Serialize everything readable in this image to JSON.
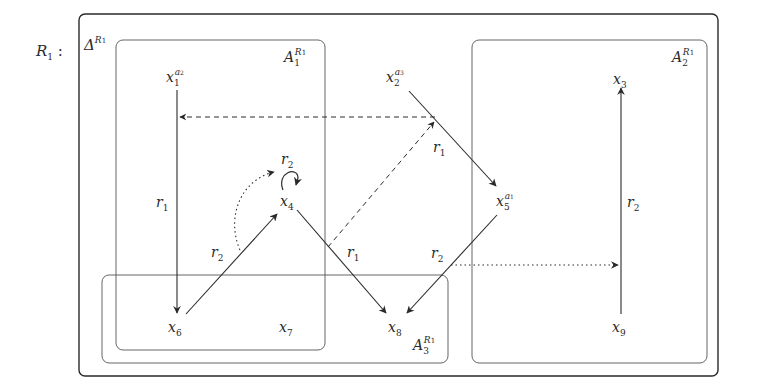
{
  "diagram": {
    "title_label": {
      "base": "R",
      "sub": "1",
      "suffix": " :"
    },
    "outer_box": {
      "base": "Δ",
      "sup_base": "R",
      "sup_sub": "1"
    },
    "regions": [
      {
        "id": "A1",
        "base": "A",
        "sub": "1",
        "sup_base": "R",
        "sup_sub": "1"
      },
      {
        "id": "A2",
        "base": "A",
        "sub": "2",
        "sup_base": "R",
        "sup_sub": "1"
      },
      {
        "id": "A3",
        "base": "A",
        "sub": "3",
        "sup_base": "R",
        "sup_sub": "1"
      }
    ],
    "nodes": [
      {
        "id": "x1",
        "base": "x",
        "sub": "1",
        "sup": "a",
        "sup_sub": "2"
      },
      {
        "id": "x2",
        "base": "x",
        "sub": "2",
        "sup": "a",
        "sup_sub": "3"
      },
      {
        "id": "x3",
        "base": "x",
        "sub": "3"
      },
      {
        "id": "x4",
        "base": "x",
        "sub": "4"
      },
      {
        "id": "x5",
        "base": "x",
        "sub": "5",
        "sup": "a",
        "sup_sub": "1"
      },
      {
        "id": "x6",
        "base": "x",
        "sub": "6"
      },
      {
        "id": "x7",
        "base": "x",
        "sub": "7"
      },
      {
        "id": "x8",
        "base": "x",
        "sub": "8"
      },
      {
        "id": "x9",
        "base": "x",
        "sub": "9"
      }
    ],
    "edges": [
      {
        "from": "x1",
        "to": "x6",
        "label": "r",
        "label_sub": "1",
        "style": "solid"
      },
      {
        "from": "x6",
        "to": "x4",
        "label": "r",
        "label_sub": "2",
        "style": "solid"
      },
      {
        "from": "x4",
        "to": "x4",
        "label": "r",
        "label_sub": "2",
        "style": "solid-loop"
      },
      {
        "from": "x4",
        "to": "x8",
        "label": "r",
        "label_sub": "1",
        "style": "solid"
      },
      {
        "from": "x2",
        "to": "x5",
        "label": "r",
        "label_sub": "1",
        "style": "solid"
      },
      {
        "from": "x5",
        "to": "x8",
        "label": "r",
        "label_sub": "2",
        "style": "solid"
      },
      {
        "from": "x9",
        "to": "x3",
        "label": "r",
        "label_sub": "2",
        "style": "solid"
      },
      {
        "from": "x2x5-edge",
        "to": "x1x6-edge",
        "style": "dashed"
      },
      {
        "from": "x4x8-edge",
        "to": "x2x5-edge",
        "style": "dashed"
      },
      {
        "from": "x6x4-edge",
        "to": "x4-loop",
        "style": "dotted"
      },
      {
        "from": "x5x8-edge",
        "to": "x9x3-edge",
        "style": "dotted"
      }
    ]
  }
}
